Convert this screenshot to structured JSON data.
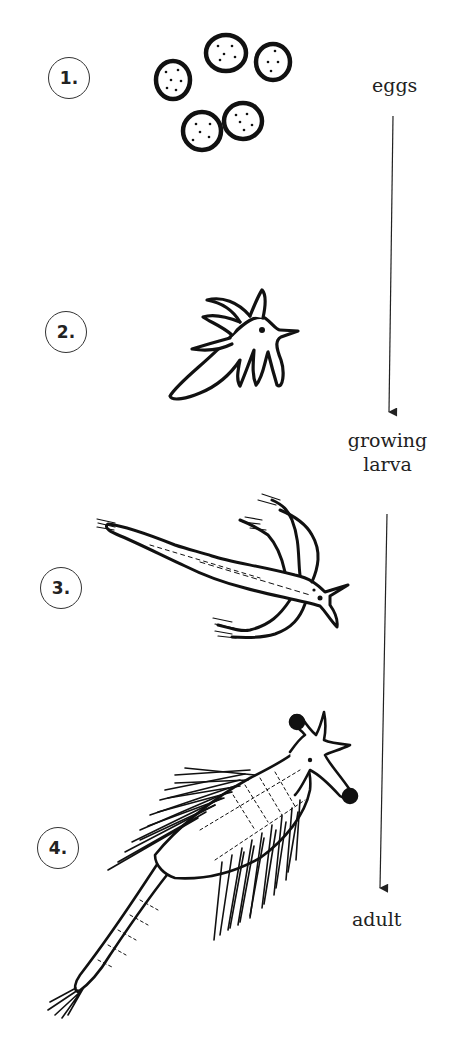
{
  "diagram": {
    "type": "life-cycle",
    "stages": [
      {
        "number": "1.",
        "name": "eggs-illustration"
      },
      {
        "number": "2.",
        "name": "early-larva-illustration"
      },
      {
        "number": "3.",
        "name": "growing-larva-illustration"
      },
      {
        "number": "4.",
        "name": "adult-illustration"
      }
    ],
    "labels": {
      "eggs": "eggs",
      "growing_line1": "growing",
      "growing_line2": "larva",
      "adult": "adult"
    },
    "colors": {
      "ink": "#111111",
      "background": "#ffffff"
    }
  }
}
